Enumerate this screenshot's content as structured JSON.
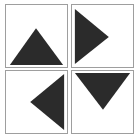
{
  "figure": {
    "layout": {
      "rows": 2,
      "columns": 2,
      "cell_count": 4
    },
    "colors": {
      "background": "#ffffff",
      "cell_fill": "#ffffff",
      "cell_border": "#9e9e9e",
      "triangle_fill": "#2b2b2b"
    }
  },
  "cells": [
    {
      "position": "top-left",
      "row": 1,
      "column": 1,
      "shape_name": "triangle-up",
      "direction": "up",
      "label": "Triangle pointing up",
      "points": "4,62 31,24 59,62"
    },
    {
      "position": "top-right",
      "row": 1,
      "column": 2,
      "shape_name": "triangle-right",
      "direction": "right",
      "label": "Triangle pointing right",
      "points": "3,4 3,61 38,33"
    },
    {
      "position": "bottom-left",
      "row": 2,
      "column": 1,
      "shape_name": "triangle-left",
      "direction": "left",
      "label": "Triangle pointing left",
      "points": "60,3 60,61 25,32"
    },
    {
      "position": "bottom-right",
      "row": 2,
      "column": 2,
      "shape_name": "triangle-down",
      "direction": "down",
      "label": "Triangle pointing down",
      "points": "3,2 60,2 32,40"
    }
  ]
}
